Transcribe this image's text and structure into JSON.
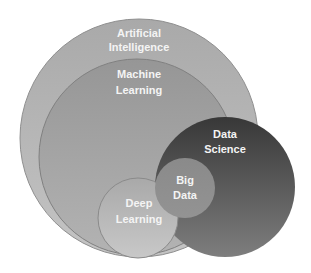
{
  "diagram": {
    "type": "nested-venn",
    "circles": [
      {
        "id": "ai",
        "label_lines": [
          "Artificial",
          "Intelligence"
        ],
        "cx": 139,
        "cy": 138,
        "r": 119,
        "color": "#adadad"
      },
      {
        "id": "ml",
        "label_lines": [
          "Machine",
          "Learning"
        ],
        "cx": 137,
        "cy": 157,
        "r": 98,
        "color": "#9c9c9c"
      },
      {
        "id": "ds",
        "label_lines": [
          "Data",
          "Science"
        ],
        "cx": 225,
        "cy": 187,
        "r": 70,
        "color_top": "#3c3c3c",
        "color_bottom": "#7a7a7a"
      },
      {
        "id": "dl",
        "label_lines": [
          "Deep",
          "Learning"
        ],
        "cx": 138,
        "cy": 218,
        "r": 40,
        "color": "#b5b5b5"
      },
      {
        "id": "bd",
        "label_lines": [
          "Big",
          "Data"
        ],
        "cx": 185,
        "cy": 188,
        "r": 30,
        "color": "#8d8d8d"
      }
    ]
  }
}
